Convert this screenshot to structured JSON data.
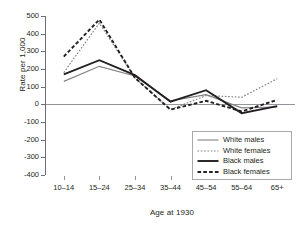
{
  "chart_data": {
    "type": "line",
    "title": "",
    "xlabel": "Age at 1930",
    "ylabel": "Rate per 1,000",
    "categories": [
      "10–14",
      "15–24",
      "25–34",
      "35–44",
      "45–54",
      "55–64",
      "65+"
    ],
    "ylim": [
      -400,
      500
    ],
    "yticks": [
      500,
      400,
      300,
      200,
      100,
      0,
      -100,
      -200,
      -300,
      -400
    ],
    "ytick_labels": [
      "500",
      "400",
      "300",
      "200",
      "100",
      "0",
      "-100",
      "-200",
      "-300",
      "-400"
    ],
    "grid": false,
    "zero_line": true,
    "legend_position": "lower right",
    "series": [
      {
        "name": "White males",
        "style": "solid-thin",
        "color": "#808285",
        "values": [
          130,
          215,
          160,
          20,
          55,
          -20,
          -15
        ]
      },
      {
        "name": "White females",
        "style": "dotted-thin",
        "color": "#808285",
        "values": [
          180,
          460,
          150,
          -30,
          50,
          40,
          145
        ]
      },
      {
        "name": "Black males",
        "style": "solid-thick",
        "color": "#231f20",
        "values": [
          170,
          250,
          165,
          15,
          80,
          -50,
          -10
        ]
      },
      {
        "name": "Black females",
        "style": "dashed-thick",
        "color": "#231f20",
        "values": [
          270,
          480,
          150,
          -30,
          20,
          -40,
          25
        ]
      }
    ]
  },
  "legend": {
    "items": [
      {
        "label": "White males"
      },
      {
        "label": "White females"
      },
      {
        "label": "Black males"
      },
      {
        "label": "Black females"
      }
    ]
  }
}
